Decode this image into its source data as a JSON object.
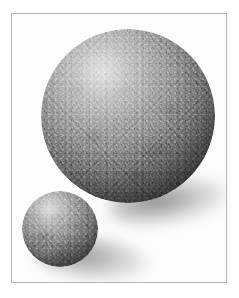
{
  "figure": {
    "caption": "",
    "background_color": "#ffffff",
    "frame_color": "#b4b4b4",
    "medium": "grayscale photograph",
    "subject_count": 2
  },
  "objects": [
    {
      "name": "large-sphere",
      "label": "Large stone sphere",
      "material": "granite",
      "surface": "coarse speckled stone",
      "highlight_position": "upper-left",
      "light_direction": "upper-left",
      "diameter_px": 174,
      "center_x_px": 116,
      "center_y_px": 102,
      "highlight_color": "#c9c9c9",
      "midtone_color": "#8e8e8e",
      "shadow_color": "#2a2a2a"
    },
    {
      "name": "small-sphere",
      "label": "Small stone sphere",
      "material": "granite",
      "surface": "coarse speckled stone",
      "highlight_position": "upper-left",
      "light_direction": "upper-left",
      "diameter_px": 76,
      "center_x_px": 48,
      "center_y_px": 215,
      "highlight_color": "#c4c4c4",
      "midtone_color": "#8a8a8a",
      "shadow_color": "#343434"
    }
  ],
  "shadows": [
    {
      "name": "large-sphere-shadow",
      "label": "Cast shadow of large sphere",
      "direction": "lower-right"
    },
    {
      "name": "small-sphere-shadow",
      "label": "Cast shadow of small sphere",
      "direction": "lower-right"
    }
  ]
}
